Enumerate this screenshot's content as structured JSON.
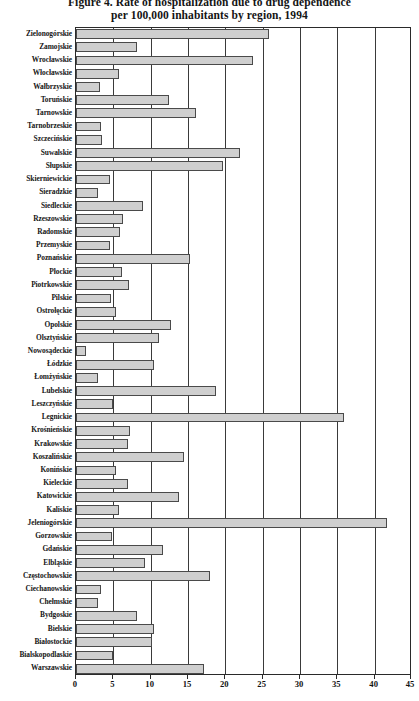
{
  "figure": {
    "title_line_1": "Figure 4. Rate of hospitalization due to drug dependence",
    "title_line_2": "per 100,000 inhabitants by region, 1994"
  },
  "chart_data": {
    "type": "bar",
    "orientation": "horizontal",
    "title": "Figure 4. Rate of hospitalization due to drug dependence per 100,000 inhabitants by region, 1994",
    "xlabel": "",
    "ylabel": "",
    "xlim": [
      0,
      45
    ],
    "xticks": [
      0,
      5,
      10,
      15,
      20,
      25,
      30,
      35,
      40,
      45
    ],
    "xtick_labels": [
      "0",
      "5",
      "10",
      "15",
      "20",
      "25",
      "30",
      "35",
      "40",
      "45"
    ],
    "grid": "vertical",
    "legend": "none",
    "bar_fill_color": "#cfcfcf",
    "bar_edge_color": "#4a4a4a",
    "categories": [
      "Zielonogórskie",
      "Zamojskie",
      "Wrocławskie",
      "Włocławskie",
      "Wałbrzyskie",
      "Toruńskie",
      "Tarnowskie",
      "Tarnobrzeskie",
      "Szczecińskie",
      "Suwalskie",
      "Słupskie",
      "Skierniewickie",
      "Sieradzkie",
      "Siedleckie",
      "Rzeszowskie",
      "Radomskie",
      "Przemyskie",
      "Poznańskie",
      "Płockie",
      "Piotrkowskie",
      "Pilskie",
      "Ostrołęckie",
      "Opolskie",
      "Olsztyńskie",
      "Nowosądeckie",
      "Łódzkie",
      "Łomżyńskie",
      "Lubelskie",
      "Leszczyńskie",
      "Legnickie",
      "Krośnieńskie",
      "Krakowskie",
      "Koszalińskie",
      "Konińskie",
      "Kieleckie",
      "Katowickie",
      "Kaliskie",
      "Jeleniogórskie",
      "Gorzowskie",
      "Gdańskie",
      "Elbląskie",
      "Częstochowskie",
      "Ciechanowskie",
      "Chełmskie",
      "Bydgoskie",
      "Bielskie",
      "Białostockie",
      "Bialskopodlaskie",
      "Warszawskie"
    ],
    "values": [
      25.9,
      8.2,
      23.7,
      5.7,
      3.2,
      12.4,
      16.1,
      3.4,
      3.5,
      22.0,
      19.7,
      4.5,
      2.9,
      9.0,
      6.3,
      5.9,
      4.5,
      15.3,
      6.2,
      7.1,
      4.7,
      5.3,
      12.7,
      11.1,
      1.3,
      10.4,
      2.9,
      18.7,
      5.0,
      35.9,
      7.2,
      6.9,
      14.4,
      5.3,
      6.9,
      13.8,
      5.8,
      41.6,
      4.8,
      11.6,
      9.3,
      17.9,
      3.4,
      2.9,
      8.2,
      10.4,
      10.2,
      4.9,
      17.1
    ]
  }
}
